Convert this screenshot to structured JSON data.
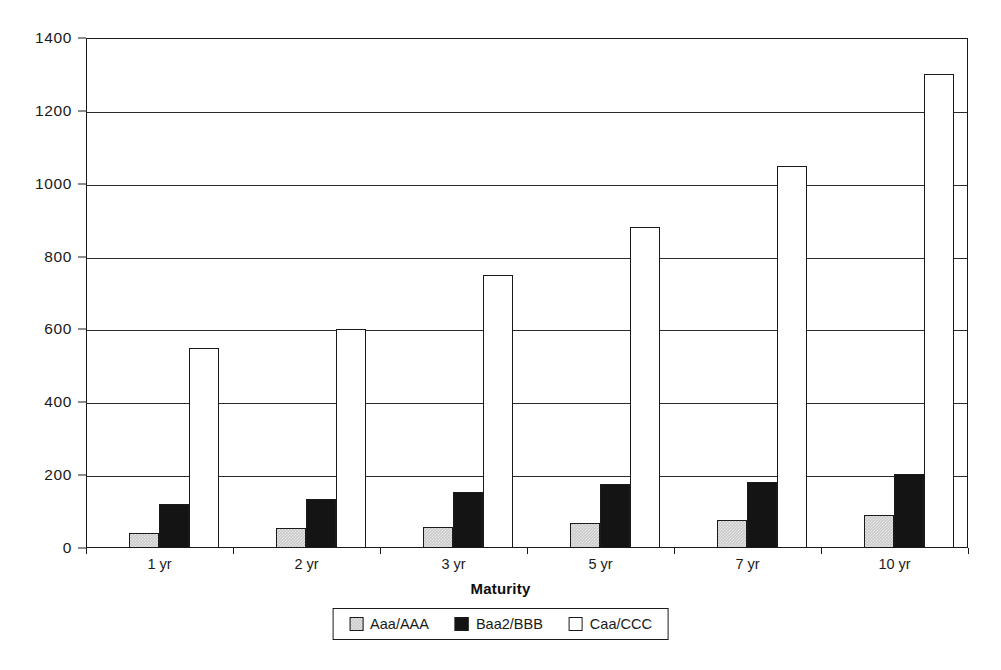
{
  "chart_data": {
    "type": "bar",
    "title": "",
    "subtitle": "",
    "xlabel": "Maturity",
    "ylabel": "",
    "categories": [
      "1 yr",
      "2 yr",
      "3 yr",
      "5 yr",
      "7 yr",
      "10 yr"
    ],
    "series": [
      {
        "name": "Aaa/AAA",
        "color": "#c9c9c9",
        "values": [
          40,
          55,
          58,
          70,
          78,
          90
        ]
      },
      {
        "name": "Baa2/BBB",
        "color": "#141414",
        "values": [
          120,
          135,
          155,
          175,
          182,
          203
        ]
      },
      {
        "name": "Caa/CCC",
        "color": "#ffffff",
        "values": [
          550,
          600,
          750,
          880,
          1050,
          1300
        ]
      }
    ],
    "ylim": [
      0,
      1400
    ],
    "y_ticks": [
      0,
      200,
      400,
      600,
      800,
      1000,
      1200,
      1400
    ],
    "y_tick_labels": [
      "0",
      "200",
      "400",
      "600",
      "800",
      "1000",
      "1200",
      "1400"
    ],
    "grid": true,
    "grid_axis": "y",
    "legend_position": "bottom",
    "legend_entries": [
      "Aaa/AAA",
      "Baa2/BBB",
      "Caa/CCC"
    ]
  }
}
